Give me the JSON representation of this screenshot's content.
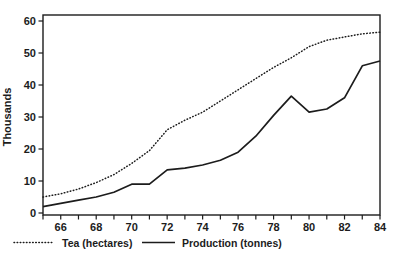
{
  "chart_data": {
    "type": "line",
    "title": "",
    "xlabel": "",
    "ylabel": "Thousands",
    "xlim": [
      65,
      84
    ],
    "ylim": [
      0,
      60
    ],
    "grid": false,
    "legend_position": "bottom-left",
    "x": [
      65,
      66,
      67,
      68,
      69,
      70,
      71,
      72,
      73,
      74,
      75,
      76,
      77,
      78,
      79,
      80,
      81,
      82,
      83,
      84
    ],
    "yticks": [
      0,
      10,
      20,
      30,
      40,
      50,
      60
    ],
    "xtick_labels": [
      66,
      68,
      70,
      72,
      74,
      76,
      78,
      80,
      82,
      84
    ],
    "series": [
      {
        "name": "Tea (hectares)",
        "style": "dotted",
        "values": [
          5,
          6,
          7.5,
          9.5,
          12,
          15.5,
          19.5,
          26,
          29,
          31.5,
          35,
          38.5,
          42,
          45.5,
          48.5,
          52,
          54,
          55,
          56,
          56.5
        ]
      },
      {
        "name": "Production (tonnes)",
        "style": "solid",
        "values": [
          2,
          3,
          4,
          5,
          6.5,
          9,
          9,
          13.5,
          14,
          15,
          16.5,
          19,
          24,
          30.5,
          36.5,
          31.5,
          32.5,
          36,
          46,
          47.5
        ]
      }
    ]
  }
}
